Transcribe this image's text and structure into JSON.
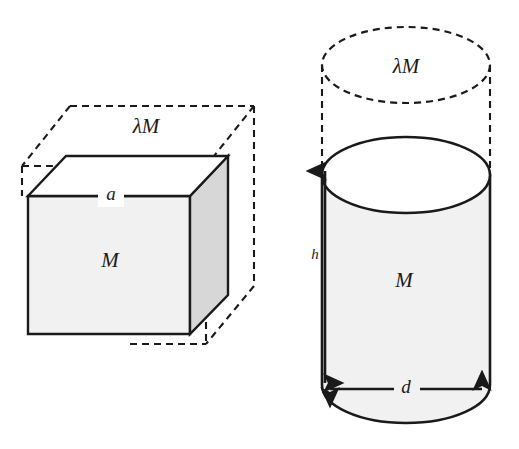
{
  "figure": {
    "background_color": "#ffffff",
    "stroke_color": "#1a1a1a",
    "fill_front": "#f1f1f1",
    "fill_side": "#d7d7d7",
    "fill_dashed_region": "#ffffff"
  },
  "cube": {
    "name": "cube-diagram",
    "labels": {
      "scaled_mass": "λM",
      "edge": "a",
      "mass": "M"
    },
    "solid_front_face": {
      "name": "cube-front-face",
      "fill": "#f1f1f1",
      "points": "28,196 190,196 190,334 28,334"
    },
    "solid_right_face": {
      "name": "cube-right-face",
      "fill": "#d7d7d7",
      "points": "190,196 228,156 228,295 190,334"
    },
    "solid_top_face": {
      "name": "cube-top-face",
      "fill": "#ffffff",
      "points": "28,196 66,156 228,156 190,196"
    },
    "dashed_outline": {
      "name": "cube-dashed-outline",
      "dash_pattern": "7,5",
      "front_rect": "22,166 252,166 252,344 22,344",
      "back_offset": "48,-40"
    }
  },
  "cylinder": {
    "name": "cylinder-diagram",
    "labels": {
      "scaled_mass": "λM",
      "height": "h",
      "diameter": "d",
      "mass": "M"
    },
    "dashed_top_ellipse": {
      "name": "cylinder-dashed-top-ellipse",
      "cx": 406,
      "cy": 65,
      "rx": 84,
      "ry": 38,
      "dash_pattern": "7,5"
    },
    "solid_top_ellipse": {
      "name": "cylinder-top-ellipse",
      "cx": 406,
      "cy": 175,
      "rx": 84,
      "ry": 38,
      "fill": "#ffffff"
    },
    "body": {
      "name": "cylinder-body",
      "fill": "#f1f1f1",
      "left_x": 322,
      "right_x": 490,
      "top_y": 175,
      "bottom_y": 385
    },
    "dimension_arrows": {
      "height_arrow": {
        "name": "height-dimension-arrow",
        "x": 325,
        "y_top": 164,
        "y_bottom": 388,
        "double_headed": true
      },
      "diameter_arrow": {
        "name": "diameter-dimension-arrow",
        "y": 389,
        "x_left": 325,
        "x_right": 487,
        "double_headed": true
      }
    }
  }
}
